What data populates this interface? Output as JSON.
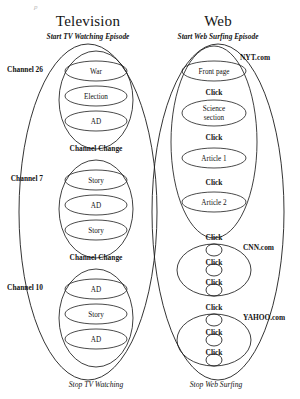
{
  "figure": {
    "top_fragment": "p",
    "columns": [
      {
        "id": "television",
        "title": "Television",
        "start_label": "Start TV Watching Episode",
        "stop_label": "Stop TV Watching",
        "groups": [
          {
            "name": "Channel 26",
            "items": [
              "War",
              "Election",
              "AD"
            ]
          },
          {
            "name": "Channel 7",
            "items": [
              "Story",
              "AD",
              "Story"
            ]
          },
          {
            "name": "Channel 10",
            "items": [
              "AD",
              "Story",
              "AD"
            ]
          }
        ],
        "transitions": [
          "Channel Change",
          "Channel Change"
        ]
      },
      {
        "id": "web",
        "title": "Web",
        "start_label": "Start Web Surfing Episode",
        "stop_label": "Stop Web Surfing",
        "groups": [
          {
            "name": "NYT.com",
            "items": [
              "Front page",
              "Science section",
              "Article 1",
              "Article 2"
            ],
            "inner_transitions": [
              "Click",
              "Click",
              "Click"
            ]
          },
          {
            "name": "CNN.com",
            "items": [
              "",
              "",
              ""
            ],
            "inner_transitions": [
              "Click",
              "Click"
            ]
          },
          {
            "name": "YAHOO.com",
            "items": [
              "",
              "",
              ""
            ],
            "inner_transitions": [
              "Click",
              "Click"
            ]
          }
        ],
        "transitions": [
          "Click",
          "Click"
        ]
      }
    ]
  },
  "colors": {
    "ink": "#1d1d1d",
    "text": "#141414",
    "background": "#ffffff",
    "faded": "#b9b9b9"
  }
}
